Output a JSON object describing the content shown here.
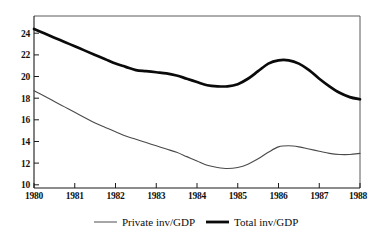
{
  "chart_data": {
    "type": "line",
    "title": "",
    "subtitle": "",
    "xlabel": "",
    "ylabel": "",
    "xlim": [
      1980,
      1988
    ],
    "ylim": [
      9.3,
      25.2
    ],
    "yticks": [
      10,
      12,
      14,
      16,
      18,
      20,
      22,
      24
    ],
    "xticks": [
      1980,
      1981,
      1982,
      1983,
      1984,
      1985,
      1986,
      1987,
      1988
    ],
    "x_tick_labels": [
      "1980",
      "1981",
      "1982",
      "1983",
      "1984",
      "1985",
      "1986",
      "1987",
      "1988"
    ],
    "y_tick_labels": [
      "10",
      "12",
      "14",
      "16",
      "18",
      "20",
      "22",
      "24"
    ],
    "grid": false,
    "legend_position": "bottom",
    "x": [
      1980.0,
      1980.25,
      1980.5,
      1980.75,
      1981.0,
      1981.25,
      1981.5,
      1981.75,
      1982.0,
      1982.25,
      1982.5,
      1982.75,
      1983.0,
      1983.25,
      1983.5,
      1983.75,
      1984.0,
      1984.25,
      1984.5,
      1984.75,
      1985.0,
      1985.25,
      1985.5,
      1985.75,
      1986.0,
      1986.25,
      1986.5,
      1986.75,
      1987.0,
      1987.25,
      1987.5,
      1987.75,
      1988.0
    ],
    "series": [
      {
        "name": "Total inv/GDP",
        "style": "thick-black",
        "color": "#0a0a0a",
        "values": [
          24.0,
          23.6,
          23.2,
          22.8,
          22.4,
          22.0,
          21.6,
          21.2,
          20.8,
          20.5,
          20.2,
          20.1,
          20.0,
          19.9,
          19.7,
          19.4,
          19.1,
          18.8,
          18.7,
          18.7,
          18.9,
          19.4,
          20.1,
          20.8,
          21.1,
          21.1,
          20.8,
          20.2,
          19.4,
          18.7,
          18.1,
          17.7,
          17.5
        ]
      },
      {
        "name": "Private inv/GDP",
        "style": "thin-grey",
        "color": "#4a4a4a",
        "values": [
          18.3,
          17.8,
          17.3,
          16.8,
          16.3,
          15.8,
          15.3,
          14.9,
          14.5,
          14.1,
          13.8,
          13.5,
          13.2,
          12.9,
          12.6,
          12.2,
          11.8,
          11.4,
          11.2,
          11.1,
          11.2,
          11.5,
          12.0,
          12.6,
          13.1,
          13.2,
          13.1,
          12.9,
          12.7,
          12.5,
          12.4,
          12.4,
          12.5
        ]
      }
    ],
    "legend": [
      {
        "label": "Private inv/GDP",
        "swatch": "thin-line"
      },
      {
        "label": "Total inv/GDP",
        "swatch": "thick-line"
      }
    ]
  },
  "colors": {
    "background": "#ffffff",
    "axis": "#1a1a1a",
    "total_series": "#0a0a0a",
    "private_series": "#4a4a4a"
  }
}
